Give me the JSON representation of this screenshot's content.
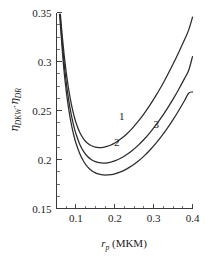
{
  "chart_data": {
    "type": "line",
    "title": "",
    "xlabel": "r_p (MKM)",
    "xlabel_symbol": "r",
    "xlabel_sub": "p",
    "xlabel_unit": "(MKM)",
    "ylabel": "η_DKW·η_DR",
    "ylabel_parts": {
      "eta1": "η",
      "sub1": "DKW",
      "dot": "·",
      "eta2": "η",
      "sub2": "DR"
    },
    "xlim": [
      0.05,
      0.4
    ],
    "ylim": [
      0.15,
      0.35
    ],
    "xticks": [
      0.1,
      0.2,
      0.3,
      0.4
    ],
    "xtick_labels": [
      "0.1",
      "0.2",
      "0.3",
      "0.4"
    ],
    "yticks": [
      0.15,
      0.2,
      0.25,
      0.3,
      0.35
    ],
    "ytick_labels": [
      "0.15",
      "0.2",
      "0.25",
      "0.3",
      "0.35"
    ],
    "x_minor_step": 0.025,
    "y_minor_step": 0.0125,
    "grid": false,
    "legend_position": "inline-annotations",
    "series": [
      {
        "name": "1",
        "label": "1",
        "label_x": 0.218,
        "label_y": 0.2405,
        "minimum": {
          "x": 0.17,
          "y": 0.218
        },
        "endpoint": {
          "x": 0.4,
          "y": 0.345
        },
        "points": [
          [
            0.06,
            0.348
          ],
          [
            0.065,
            0.325
          ],
          [
            0.07,
            0.3055
          ],
          [
            0.075,
            0.289
          ],
          [
            0.08,
            0.275
          ],
          [
            0.085,
            0.2632
          ],
          [
            0.09,
            0.2532
          ],
          [
            0.095,
            0.2448
          ],
          [
            0.1,
            0.2378
          ],
          [
            0.11,
            0.2275
          ],
          [
            0.12,
            0.2208
          ],
          [
            0.13,
            0.2165
          ],
          [
            0.14,
            0.214
          ],
          [
            0.15,
            0.2126
          ],
          [
            0.16,
            0.2122
          ],
          [
            0.17,
            0.2124
          ],
          [
            0.18,
            0.2133
          ],
          [
            0.19,
            0.2148
          ],
          [
            0.2,
            0.2168
          ],
          [
            0.215,
            0.2208
          ],
          [
            0.23,
            0.2258
          ],
          [
            0.245,
            0.2318
          ],
          [
            0.26,
            0.2388
          ],
          [
            0.275,
            0.2466
          ],
          [
            0.29,
            0.2552
          ],
          [
            0.305,
            0.2646
          ],
          [
            0.32,
            0.2748
          ],
          [
            0.335,
            0.2858
          ],
          [
            0.35,
            0.2974
          ],
          [
            0.365,
            0.3098
          ],
          [
            0.38,
            0.3228
          ],
          [
            0.39,
            0.332
          ],
          [
            0.4,
            0.3452
          ]
        ]
      },
      {
        "name": "2",
        "label": "2",
        "label_x": 0.205,
        "label_y": 0.2135,
        "minimum": {
          "x": 0.18,
          "y": 0.199
        },
        "endpoint": {
          "x": 0.4,
          "y": 0.305
        },
        "points": [
          [
            0.059,
            0.348
          ],
          [
            0.065,
            0.318
          ],
          [
            0.07,
            0.2965
          ],
          [
            0.075,
            0.279
          ],
          [
            0.08,
            0.2645
          ],
          [
            0.085,
            0.2522
          ],
          [
            0.09,
            0.242
          ],
          [
            0.095,
            0.2334
          ],
          [
            0.1,
            0.2262
          ],
          [
            0.11,
            0.2154
          ],
          [
            0.12,
            0.208
          ],
          [
            0.13,
            0.203
          ],
          [
            0.14,
            0.1998
          ],
          [
            0.15,
            0.1978
          ],
          [
            0.16,
            0.1968
          ],
          [
            0.17,
            0.1964
          ],
          [
            0.18,
            0.1966
          ],
          [
            0.19,
            0.1974
          ],
          [
            0.2,
            0.1986
          ],
          [
            0.215,
            0.2012
          ],
          [
            0.23,
            0.2048
          ],
          [
            0.245,
            0.2092
          ],
          [
            0.26,
            0.2144
          ],
          [
            0.275,
            0.2204
          ],
          [
            0.29,
            0.2272
          ],
          [
            0.305,
            0.2348
          ],
          [
            0.32,
            0.243
          ],
          [
            0.335,
            0.252
          ],
          [
            0.35,
            0.2616
          ],
          [
            0.365,
            0.272
          ],
          [
            0.38,
            0.283
          ],
          [
            0.39,
            0.2908
          ],
          [
            0.4,
            0.305
          ]
        ]
      },
      {
        "name": "3",
        "label": "3",
        "label_x": 0.307,
        "label_y": 0.232,
        "minimum": {
          "x": 0.185,
          "y": 0.185
        },
        "endpoint": {
          "x": 0.4,
          "y": 0.268
        },
        "points": [
          [
            0.058,
            0.348
          ],
          [
            0.065,
            0.311
          ],
          [
            0.07,
            0.288
          ],
          [
            0.075,
            0.27
          ],
          [
            0.08,
            0.2552
          ],
          [
            0.085,
            0.2428
          ],
          [
            0.09,
            0.2326
          ],
          [
            0.095,
            0.224
          ],
          [
            0.1,
            0.2168
          ],
          [
            0.11,
            0.2058
          ],
          [
            0.12,
            0.198
          ],
          [
            0.13,
            0.1925
          ],
          [
            0.14,
            0.1888
          ],
          [
            0.15,
            0.1864
          ],
          [
            0.16,
            0.185
          ],
          [
            0.17,
            0.1843
          ],
          [
            0.18,
            0.1842
          ],
          [
            0.19,
            0.1846
          ],
          [
            0.2,
            0.1854
          ],
          [
            0.215,
            0.1874
          ],
          [
            0.23,
            0.1902
          ],
          [
            0.245,
            0.1938
          ],
          [
            0.26,
            0.1982
          ],
          [
            0.275,
            0.2034
          ],
          [
            0.29,
            0.2094
          ],
          [
            0.305,
            0.2162
          ],
          [
            0.32,
            0.2236
          ],
          [
            0.335,
            0.2318
          ],
          [
            0.35,
            0.2406
          ],
          [
            0.365,
            0.2502
          ],
          [
            0.38,
            0.2604
          ],
          [
            0.39,
            0.2676
          ],
          [
            0.4,
            0.269
          ]
        ]
      }
    ]
  }
}
